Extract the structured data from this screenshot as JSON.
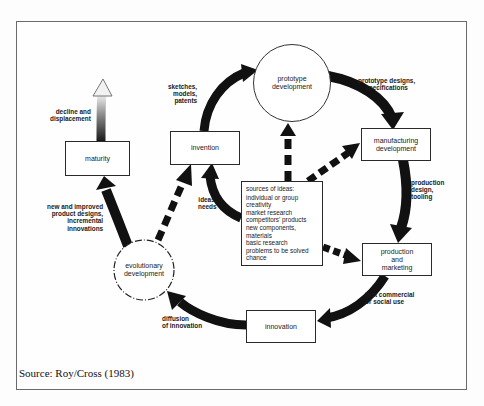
{
  "diagram": {
    "type": "innovation-cycle",
    "nodes": {
      "prototype": {
        "label": "prototype\ndevelopment",
        "shape": "circle"
      },
      "manufacturing": {
        "label": "manufacturing\ndevelopment",
        "shape": "box"
      },
      "production": {
        "label": "production\nand\nmarketing",
        "shape": "box"
      },
      "innovation": {
        "label": "innovation",
        "shape": "box"
      },
      "evolutionary": {
        "label": "evolutionary\ndevelopment",
        "shape": "dashed-circle"
      },
      "maturity": {
        "label": "maturity",
        "shape": "box"
      },
      "invention": {
        "label": "invention",
        "shape": "box"
      }
    },
    "edge_labels": {
      "invention_to_prototype": "sketches,\nmodels,\npatents",
      "prototype_to_manufacturing": "prototype designs,\nspecifications",
      "manufacturing_to_production": "production\ndesign,\ntooling",
      "production_to_innovation": "first commercial\nor social use",
      "innovation_to_evolutionary": "diffusion\nof innovation",
      "evolutionary_to_maturity": "new and improved\nproduct designs,\nincremental\ninnovations",
      "maturity_decline": "decline and\ndisplacement",
      "sources_to_invention": "ideas,\nneeds"
    },
    "sources": {
      "title": "sources of ideas:",
      "items": [
        "individual or group",
        "creativity",
        "market research",
        "competitors' products",
        "new components,",
        "materials",
        "basic research",
        "problems to be solved",
        "chance"
      ]
    },
    "edges": [
      {
        "from": "invention",
        "to": "prototype",
        "style": "solid"
      },
      {
        "from": "prototype",
        "to": "manufacturing",
        "style": "solid"
      },
      {
        "from": "manufacturing",
        "to": "production",
        "style": "solid"
      },
      {
        "from": "production",
        "to": "innovation",
        "style": "solid"
      },
      {
        "from": "innovation",
        "to": "evolutionary",
        "style": "solid"
      },
      {
        "from": "evolutionary",
        "to": "maturity",
        "style": "solid"
      },
      {
        "from": "maturity",
        "to": "decline",
        "style": "gradient"
      },
      {
        "from": "sources",
        "to": "invention",
        "style": "solid"
      },
      {
        "from": "sources",
        "to": "prototype",
        "style": "dashed"
      },
      {
        "from": "sources",
        "to": "manufacturing",
        "style": "dashed"
      },
      {
        "from": "sources",
        "to": "production",
        "style": "dashed"
      },
      {
        "from": "evolutionary",
        "to": "invention",
        "style": "dashed"
      }
    ]
  },
  "caption": "Source: Roy/Cross (1983)"
}
